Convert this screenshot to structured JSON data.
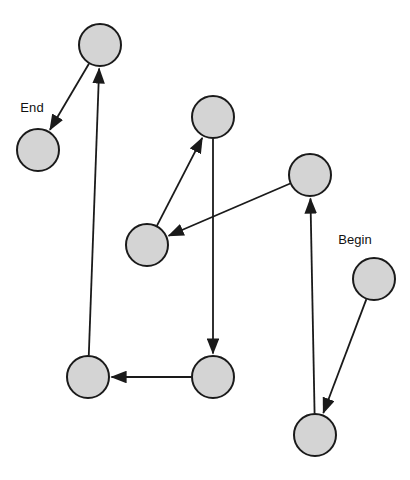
{
  "diagram": {
    "width": 410,
    "height": 480,
    "background_color": "#ffffff",
    "node_fill_color": "#d4d4d4",
    "node_stroke_color": "#1a1a1a",
    "edge_color": "#1a1a1a",
    "node_radius": 21,
    "labels": {
      "begin": "Begin",
      "end": "End"
    },
    "nodes": [
      {
        "id": "n-end",
        "cx": 38,
        "cy": 150,
        "r": 21,
        "label": "End",
        "label_x": 32,
        "label_y": 112,
        "has_label": true
      },
      {
        "id": "n-1",
        "cx": 100,
        "cy": 45,
        "r": 21,
        "label": "",
        "label_x": 0,
        "label_y": 0,
        "has_label": false
      },
      {
        "id": "n-2",
        "cx": 213,
        "cy": 117,
        "r": 21,
        "label": "",
        "label_x": 0,
        "label_y": 0,
        "has_label": false
      },
      {
        "id": "n-3",
        "cx": 310,
        "cy": 175,
        "r": 21,
        "label": "",
        "label_x": 0,
        "label_y": 0,
        "has_label": false
      },
      {
        "id": "n-4",
        "cx": 147,
        "cy": 245,
        "r": 21,
        "label": "",
        "label_x": 0,
        "label_y": 0,
        "has_label": false
      },
      {
        "id": "n-begin",
        "cx": 374,
        "cy": 279,
        "r": 21,
        "label": "Begin",
        "label_x": 355,
        "label_y": 244,
        "has_label": true
      },
      {
        "id": "n-5",
        "cx": 88,
        "cy": 377,
        "r": 21,
        "label": "",
        "label_x": 0,
        "label_y": 0,
        "has_label": false
      },
      {
        "id": "n-6",
        "cx": 213,
        "cy": 377,
        "r": 21,
        "label": "",
        "label_x": 0,
        "label_y": 0,
        "has_label": false
      },
      {
        "id": "n-7",
        "cx": 315,
        "cy": 435,
        "r": 21,
        "label": "",
        "label_x": 0,
        "label_y": 0,
        "has_label": false
      }
    ],
    "edges": [
      {
        "id": "e-begin-7",
        "from": "n-begin",
        "to": "n-7",
        "order": 1
      },
      {
        "id": "e-7-3",
        "from": "n-7",
        "to": "n-3",
        "order": 2
      },
      {
        "id": "e-3-4",
        "from": "n-3",
        "to": "n-4",
        "order": 3
      },
      {
        "id": "e-4-2",
        "from": "n-4",
        "to": "n-2",
        "order": 4
      },
      {
        "id": "e-2-6",
        "from": "n-2",
        "to": "n-6",
        "order": 5
      },
      {
        "id": "e-6-5",
        "from": "n-6",
        "to": "n-5",
        "order": 6
      },
      {
        "id": "e-5-1",
        "from": "n-5",
        "to": "n-1",
        "order": 7
      },
      {
        "id": "e-1-end",
        "from": "n-1",
        "to": "n-end",
        "order": 8
      }
    ]
  }
}
